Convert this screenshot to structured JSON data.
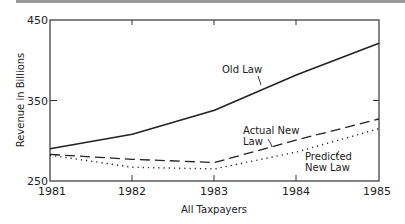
{
  "chart_data": {
    "type": "line",
    "title": "",
    "xlabel": "All Taxpayers",
    "ylabel": "Revenue in Billions",
    "x": [
      1981,
      1982,
      1983,
      1984,
      1985
    ],
    "xticks": [
      "1981",
      "1982",
      "1983",
      "1984",
      "1985"
    ],
    "yticks": [
      "250",
      "350",
      "450"
    ],
    "ylim": [
      250,
      450
    ],
    "grid": false,
    "legend": "inline labels",
    "series": [
      {
        "name": "Old Law",
        "style": "solid",
        "values": [
          290,
          308,
          338,
          382,
          421
        ]
      },
      {
        "name": "Actual New Law",
        "style": "dashed",
        "values": [
          283,
          277,
          273,
          301,
          327
        ]
      },
      {
        "name": "Predicted New Law",
        "style": "dotted",
        "values": [
          282,
          267,
          265,
          286,
          315
        ]
      }
    ],
    "annotations": {
      "old_law": "Old Law",
      "actual_line1": "Actual New",
      "actual_line2": "Law",
      "predicted_line1": "Predicted",
      "predicted_line2": "New Law"
    }
  }
}
